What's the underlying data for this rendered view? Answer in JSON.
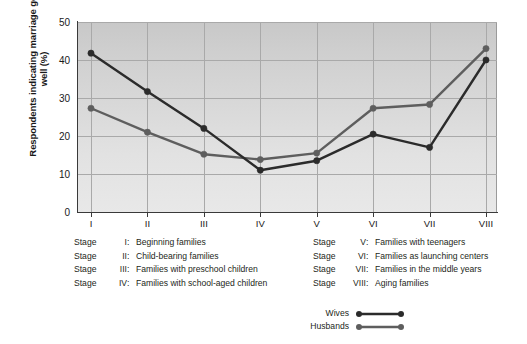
{
  "chart_data": {
    "type": "line",
    "title": "",
    "xlabel": "",
    "ylabel": "Respondents indicating marriage going well (%)",
    "categories": [
      "I",
      "II",
      "III",
      "IV",
      "V",
      "VI",
      "VII",
      "VIII"
    ],
    "ylim": [
      0,
      50
    ],
    "yticks": [
      0,
      10,
      20,
      30,
      40,
      50
    ],
    "grid": true,
    "legend_position": "bottom-right",
    "series": [
      {
        "name": "Wives",
        "color": "#2b2b2b",
        "values": [
          41.8,
          31.7,
          22.0,
          11.0,
          13.5,
          20.5,
          17.0,
          40.0
        ]
      },
      {
        "name": "Husbands",
        "color": "#5e5e5e",
        "values": [
          27.3,
          21.0,
          15.2,
          13.8,
          15.5,
          27.3,
          28.3,
          43.0
        ]
      }
    ]
  },
  "axis": {
    "y_label": "Respondents indicating marriage going well (%)",
    "y_ticks": [
      "50",
      "40",
      "30",
      "20",
      "10",
      "0"
    ],
    "x_ticks": [
      "I",
      "II",
      "III",
      "IV",
      "V",
      "VI",
      "VII",
      "VIII"
    ]
  },
  "key": {
    "left": [
      {
        "stage": "Stage",
        "num": "I",
        "colon": ":",
        "text": "Beginning families"
      },
      {
        "stage": "Stage",
        "num": "II",
        "colon": ":",
        "text": "Child-bearing families"
      },
      {
        "stage": "Stage",
        "num": "III",
        "colon": ":",
        "text": "Families with preschool children"
      },
      {
        "stage": "Stage",
        "num": "IV",
        "colon": ":",
        "text": "Families with school-aged children"
      }
    ],
    "right": [
      {
        "stage": "Stage",
        "num": "V",
        "colon": ":",
        "text": "Families with teenagers"
      },
      {
        "stage": "Stage",
        "num": "VI",
        "colon": ":",
        "text": "Families as launching centers"
      },
      {
        "stage": "Stage",
        "num": "VII",
        "colon": ":",
        "text": "Families in the middle years"
      },
      {
        "stage": "Stage",
        "num": "VIII",
        "colon": ":",
        "text": "Aging families"
      }
    ]
  },
  "legend": {
    "items": [
      {
        "label": "Wives",
        "color": "#2b2b2b"
      },
      {
        "label": "Husbands",
        "color": "#5e5e5e"
      }
    ]
  }
}
